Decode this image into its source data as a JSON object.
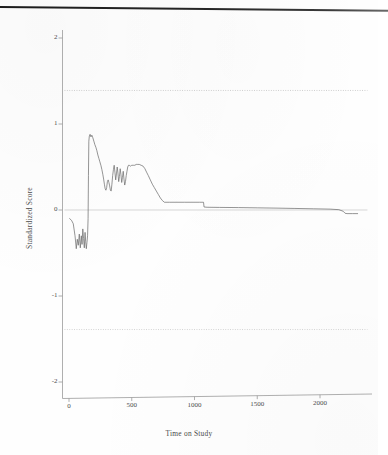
{
  "figure": {
    "background_color": "#fefefe",
    "line_color": "#6b6b6b",
    "axis_color": "#9a9a9a",
    "ref_line_color": "#c9c9c9",
    "scan_edge_color": "#222222"
  },
  "chart_data": {
    "type": "line",
    "title": "",
    "xlabel": "Time on Study",
    "ylabel": "Standardized Score",
    "xlim": [
      -40,
      2330
    ],
    "ylim": [
      -2.25,
      2.25
    ],
    "grid": false,
    "legend": null,
    "xticks": [
      0,
      500,
      1000,
      1500,
      2000
    ],
    "xtick_labels": [
      "0",
      "500",
      "1000",
      "1500",
      "2000"
    ],
    "yticks": [
      -2,
      -1,
      0,
      1,
      2
    ],
    "ytick_labels": [
      "-2",
      "-1",
      "0",
      "1",
      "2"
    ],
    "reference_lines": [
      {
        "name": "upper-boundary",
        "y": 1.39,
        "style": "dotted",
        "color": "#c9c9c9"
      },
      {
        "name": "zero-line",
        "y": 0.0,
        "style": "solid",
        "color": "#c4c4c4"
      },
      {
        "name": "lower-boundary",
        "y": -1.39,
        "style": "dotted",
        "color": "#cfcfcf"
      }
    ],
    "series": [
      {
        "name": "standardized-score",
        "color": "#6b6b6b",
        "x": [
          5,
          20,
          34,
          48,
          58,
          66,
          74,
          82,
          90,
          98,
          104,
          110,
          116,
          122,
          128,
          133,
          138,
          143,
          148,
          152,
          155,
          158,
          162,
          168,
          175,
          182,
          190,
          198,
          206,
          214,
          222,
          230,
          238,
          246,
          254,
          262,
          270,
          276,
          282,
          288,
          294,
          300,
          306,
          312,
          318,
          324,
          330,
          336,
          342,
          348,
          354,
          360,
          366,
          372,
          378,
          384,
          390,
          396,
          402,
          408,
          414,
          420,
          426,
          432,
          438,
          444,
          450,
          456,
          462,
          468,
          474,
          480,
          490,
          500,
          512,
          524,
          536,
          548,
          560,
          575,
          590,
          605,
          618,
          632,
          648,
          664,
          680,
          696,
          712,
          728,
          744,
          760,
          800,
          860,
          920,
          980,
          1040,
          1072,
          1076,
          1100,
          1200,
          1350,
          1500,
          1650,
          1800,
          1950,
          2080,
          2150,
          2185,
          2200,
          2215,
          2260,
          2300
        ],
        "y": [
          -0.1,
          -0.12,
          -0.16,
          -0.3,
          -0.45,
          -0.34,
          -0.41,
          -0.28,
          -0.44,
          -0.3,
          -0.4,
          -0.22,
          -0.33,
          -0.44,
          -0.26,
          -0.37,
          -0.45,
          -0.38,
          -0.3,
          -0.1,
          0.4,
          0.8,
          0.86,
          0.88,
          0.85,
          0.87,
          0.84,
          0.8,
          0.76,
          0.73,
          0.69,
          0.64,
          0.6,
          0.56,
          0.52,
          0.47,
          0.41,
          0.36,
          0.3,
          0.25,
          0.23,
          0.26,
          0.33,
          0.35,
          0.32,
          0.28,
          0.23,
          0.22,
          0.3,
          0.4,
          0.47,
          0.52,
          0.44,
          0.35,
          0.42,
          0.5,
          0.43,
          0.33,
          0.39,
          0.48,
          0.41,
          0.32,
          0.38,
          0.45,
          0.36,
          0.29,
          0.33,
          0.4,
          0.45,
          0.5,
          0.52,
          0.52,
          0.51,
          0.52,
          0.52,
          0.52,
          0.53,
          0.53,
          0.53,
          0.52,
          0.51,
          0.48,
          0.44,
          0.4,
          0.35,
          0.3,
          0.26,
          0.22,
          0.18,
          0.14,
          0.11,
          0.09,
          0.09,
          0.09,
          0.09,
          0.09,
          0.09,
          0.09,
          0.035,
          0.032,
          0.03,
          0.028,
          0.025,
          0.022,
          0.018,
          0.014,
          0.01,
          0.004,
          -0.015,
          -0.038,
          -0.042,
          -0.042,
          -0.042
        ]
      }
    ]
  }
}
